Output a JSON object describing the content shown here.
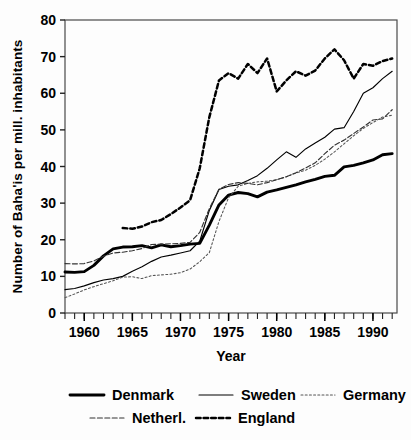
{
  "chart_data": {
    "type": "line",
    "title": "",
    "xlabel": "Year",
    "ylabel": "Number of Baha'is per mill. inhabitants",
    "xlim": [
      1958,
      1992.5
    ],
    "ylim": [
      0,
      80
    ],
    "yticks": [
      0,
      10,
      20,
      30,
      40,
      50,
      60,
      70,
      80
    ],
    "xticks": [
      1960,
      1965,
      1970,
      1975,
      1980,
      1985,
      1990
    ],
    "xtick_labels": [
      "1960",
      "1965",
      "1970",
      "1975",
      "1980",
      "1985",
      "1990"
    ],
    "ytick_labels": [
      "0",
      "10",
      "20",
      "30",
      "40",
      "50",
      "60",
      "70",
      "80"
    ],
    "x_minor_tick_step": 1,
    "grid": false,
    "legend_position": "below",
    "series": [
      {
        "name": "Denmark",
        "style": "solid-thick",
        "color": "#000000",
        "x": [
          1958,
          1959,
          1960,
          1961,
          1962,
          1963,
          1964,
          1965,
          1966,
          1967,
          1968,
          1969,
          1970,
          1971,
          1972,
          1973,
          1974,
          1975,
          1976,
          1977,
          1978,
          1979,
          1980,
          1981,
          1982,
          1983,
          1984,
          1985,
          1986,
          1987,
          1988,
          1989,
          1990,
          1991,
          1992
        ],
        "values": [
          11.2,
          11.1,
          11.3,
          13.0,
          15.6,
          17.5,
          18.0,
          18.1,
          18.4,
          17.8,
          18.6,
          18.1,
          18.4,
          18.8,
          19.0,
          24.0,
          29.5,
          32.2,
          32.9,
          32.6,
          31.7,
          33.0,
          33.6,
          34.3,
          35.0,
          35.8,
          36.5,
          37.3,
          37.6,
          39.9,
          40.3,
          41.0,
          41.8,
          43.2,
          43.5
        ]
      },
      {
        "name": "Sweden",
        "style": "solid-thin",
        "color": "#000000",
        "x": [
          1958,
          1959,
          1960,
          1961,
          1962,
          1963,
          1964,
          1965,
          1966,
          1967,
          1968,
          1969,
          1970,
          1971,
          1972,
          1973,
          1974,
          1975,
          1976,
          1977,
          1978,
          1979,
          1980,
          1981,
          1982,
          1983,
          1984,
          1985,
          1986,
          1987,
          1988,
          1989,
          1990,
          1991,
          1992
        ],
        "values": [
          6.4,
          6.7,
          7.4,
          8.3,
          9.0,
          9.4,
          10.0,
          11.4,
          12.6,
          14.1,
          15.3,
          15.8,
          16.4,
          17.0,
          19.6,
          28.0,
          33.7,
          34.6,
          35.0,
          36.2,
          37.5,
          39.5,
          41.8,
          44.0,
          42.5,
          44.8,
          46.4,
          48.0,
          50.2,
          50.6,
          55.0,
          60.0,
          61.5,
          64.0,
          66.0
        ]
      },
      {
        "name": "Germany",
        "style": "dotted-fine",
        "color": "#555555",
        "x": [
          1958,
          1959,
          1960,
          1961,
          1962,
          1963,
          1964,
          1965,
          1966,
          1967,
          1968,
          1969,
          1970,
          1971,
          1972,
          1973,
          1974,
          1975,
          1976,
          1977,
          1978,
          1979,
          1980,
          1981,
          1982,
          1983,
          1984,
          1985,
          1986,
          1987,
          1988,
          1989,
          1990,
          1991,
          1992
        ],
        "values": [
          4.2,
          5.2,
          6.3,
          7.2,
          8.0,
          8.8,
          9.8,
          9.9,
          9.4,
          10.2,
          10.4,
          10.6,
          11.0,
          12.0,
          14.0,
          16.5,
          25.0,
          31.5,
          34.6,
          35.4,
          35.8,
          36.0,
          36.4,
          37.2,
          38.2,
          39.0,
          40.3,
          42.0,
          44.0,
          46.2,
          48.4,
          50.4,
          52.0,
          53.5,
          54.0
        ]
      },
      {
        "name": "Netherl.",
        "style": "dashed-fine",
        "color": "#333333",
        "x": [
          1958,
          1959,
          1960,
          1961,
          1962,
          1963,
          1964,
          1965,
          1966,
          1967,
          1968,
          1969,
          1970,
          1971,
          1972,
          1973,
          1974,
          1975,
          1976,
          1977,
          1978,
          1979,
          1980,
          1981,
          1982,
          1983,
          1984,
          1985,
          1986,
          1987,
          1988,
          1989,
          1990,
          1991,
          1992
        ],
        "values": [
          13.5,
          13.4,
          13.5,
          14.2,
          15.5,
          16.4,
          16.6,
          17.0,
          17.6,
          18.7,
          18.8,
          18.9,
          19.0,
          19.3,
          22.0,
          28.5,
          33.8,
          35.1,
          35.6,
          35.4,
          35.0,
          35.6,
          36.4,
          37.2,
          38.3,
          39.6,
          41.0,
          43.5,
          45.8,
          47.2,
          49.0,
          50.8,
          52.7,
          53.0,
          55.5
        ]
      },
      {
        "name": "England",
        "style": "dashed-bold",
        "color": "#000000",
        "x": [
          1964,
          1965,
          1966,
          1967,
          1968,
          1969,
          1970,
          1971,
          1972,
          1973,
          1974,
          1975,
          1976,
          1977,
          1978,
          1979,
          1980,
          1981,
          1982,
          1983,
          1984,
          1985,
          1986,
          1987,
          1988,
          1989,
          1990,
          1991,
          1992
        ],
        "values": [
          23.2,
          23.0,
          23.6,
          24.8,
          25.4,
          27.0,
          28.8,
          30.8,
          39.5,
          53.5,
          63.5,
          65.5,
          64.0,
          68.0,
          65.5,
          69.5,
          60.5,
          63.5,
          66.0,
          64.8,
          66.2,
          69.5,
          72.0,
          69.0,
          64.0,
          68.0,
          67.5,
          68.8,
          69.5
        ]
      }
    ]
  },
  "legend": {
    "items": [
      {
        "label": "Denmark",
        "style": "solid-thick"
      },
      {
        "label": "Sweden",
        "style": "solid-thin"
      },
      {
        "label": "Germany",
        "style": "dotted-fine"
      },
      {
        "label": "Netherl.",
        "style": "dashed-fine"
      },
      {
        "label": "England",
        "style": "dashed-bold"
      }
    ]
  }
}
